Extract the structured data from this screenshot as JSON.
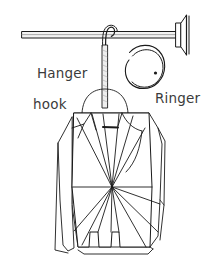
{
  "figure": {
    "background_color": "#ffffff",
    "line_color": "#1a1a1a",
    "text_color": "#3b3b3b",
    "width": 211,
    "height": 278
  },
  "labels": {
    "hanger_hook": {
      "line1": "Hanger",
      "line2": "hook"
    },
    "ringer": "Ringer"
  },
  "parts": {
    "rod": "closet-rod",
    "wall_flange": "wall-mount-flange",
    "hook": "hanger-hook",
    "hook_shaft": "hanger-hook-shaft",
    "hanger_shoulder": "hanger-shoulder-arc",
    "ring": "split-ring",
    "ring_dot": "ring-end-dot",
    "garment": "garment-outline",
    "fan": "radiating-fold-lines",
    "tag": "garment-tag"
  }
}
